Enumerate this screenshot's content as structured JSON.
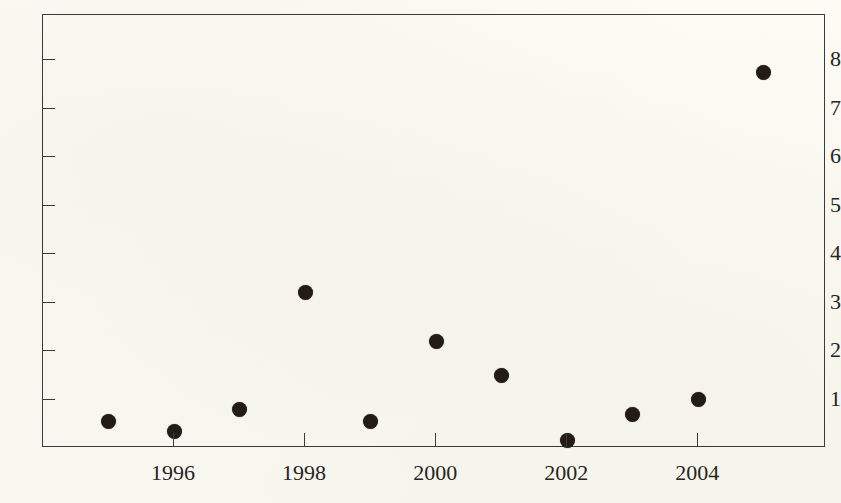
{
  "chart_data": {
    "type": "scatter",
    "title": "",
    "subtitle": "",
    "xlabel": "",
    "ylabel": "",
    "x": [
      1995,
      1996,
      1997,
      1998,
      1999,
      2000,
      2001,
      2002,
      2003,
      2004,
      2005
    ],
    "values": [
      0.55,
      0.35,
      0.8,
      3.2,
      0.55,
      2.2,
      1.5,
      0.15,
      0.7,
      1.0,
      7.75
    ],
    "points": [
      {
        "x": 1995,
        "y": 0.55
      },
      {
        "x": 1996,
        "y": 0.35
      },
      {
        "x": 1997,
        "y": 0.8
      },
      {
        "x": 1998,
        "y": 3.2
      },
      {
        "x": 1999,
        "y": 0.55
      },
      {
        "x": 2000,
        "y": 2.2
      },
      {
        "x": 2001,
        "y": 1.5
      },
      {
        "x": 2002,
        "y": 0.15
      },
      {
        "x": 2003,
        "y": 0.7
      },
      {
        "x": 2004,
        "y": 1.0
      },
      {
        "x": 2005,
        "y": 7.75
      }
    ],
    "xticks": [
      1996,
      1998,
      2000,
      2002,
      2004
    ],
    "xtick_labels": [
      "1996",
      "1998",
      "2000",
      "2002",
      "2004"
    ],
    "yticks": [
      1,
      2,
      3,
      4,
      5,
      6,
      7,
      8
    ],
    "ytick_labels": [
      "1",
      "2",
      "3",
      "4",
      "5",
      "6",
      "7",
      "8"
    ],
    "xlim": [
      1994.0,
      2005.95
    ],
    "ylim": [
      0.0,
      8.93
    ],
    "grid": false,
    "legend": null,
    "marker": "filled-circle",
    "marker_color": "#231c15",
    "background_color": "#fbfaf3",
    "axis_color": "#3a3a38"
  }
}
